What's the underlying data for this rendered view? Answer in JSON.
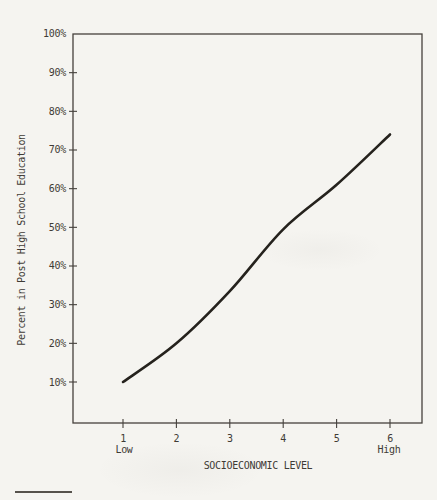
{
  "figure": {
    "x_low_label": "Low",
    "x_high_label": "High"
  },
  "chart_data": {
    "type": "line",
    "title": "",
    "xlabel": "SOCIOECONOMIC LEVEL",
    "ylabel": "Percent in Post High School Education",
    "x": [
      1,
      2,
      3,
      4,
      5,
      6
    ],
    "y_percent": [
      10,
      20,
      33.5,
      49.5,
      61,
      74
    ],
    "x_tick_labels": [
      "1",
      "2",
      "3",
      "4",
      "5",
      "6"
    ],
    "y_tick_labels": [
      "100%",
      "90%",
      "80%",
      "70%",
      "60%",
      "50%",
      "40%",
      "30%",
      "20%",
      "10%"
    ],
    "y_tick_values": [
      100,
      90,
      80,
      70,
      60,
      50,
      40,
      30,
      20,
      10
    ],
    "xlim": [
      1,
      6
    ],
    "ylim": [
      0,
      100
    ],
    "grid": false,
    "legend_position": "none",
    "line_color": "#25221d",
    "axis_color": "#45413c",
    "text_color": "#3f3b35"
  }
}
